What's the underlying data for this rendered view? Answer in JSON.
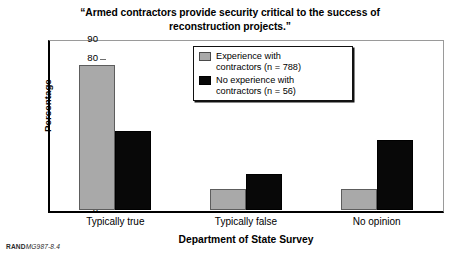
{
  "chart_data": {
    "type": "bar",
    "title": "“Armed contractors provide security critical to the success of reconstruction projects.”",
    "xlabel": "Department of State Survey",
    "ylabel": "Percentage",
    "categories": [
      "Typically true",
      "Typically false",
      "No opinion"
    ],
    "series": [
      {
        "name": "Experience with contractors (n = 788)",
        "color": "#a9a9a9",
        "values": [
          77,
          11,
          11
        ]
      },
      {
        "name": "No experience with contractors (n = 56)",
        "color": "#080808",
        "values": [
          42,
          19,
          37
        ]
      }
    ],
    "ylim": [
      0,
      90
    ],
    "yticks": [
      0,
      10,
      20,
      30,
      40,
      50,
      60,
      70,
      80,
      90
    ],
    "grid": false,
    "legend_position": "upper center"
  },
  "legend": {
    "entries": [
      {
        "label": "Experience with\ncontractors (n = 788)",
        "swatch": "gray"
      },
      {
        "label": "No experience with\ncontractors (n = 56)",
        "swatch": "black"
      }
    ]
  },
  "footer": {
    "organization": "RAND",
    "figure_code": "MG987-8.4"
  }
}
